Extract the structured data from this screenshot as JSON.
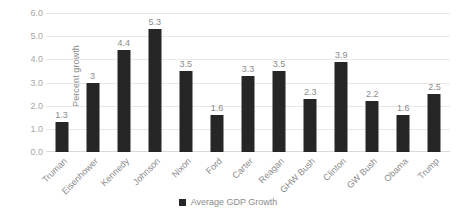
{
  "chart_data": {
    "type": "bar",
    "title": "",
    "xlabel": "",
    "ylabel": "Percent growth",
    "ylim": [
      0,
      6
    ],
    "ytick_step": 1,
    "ytick_labels": [
      "0.0",
      "1.0",
      "2.0",
      "3.0",
      "4.0",
      "5.0",
      "6.0"
    ],
    "grid": true,
    "legend_position": "bottom-center",
    "categories": [
      "Truman",
      "Eisenhower",
      "Kennedy",
      "Johnson",
      "Nixon",
      "Ford",
      "Carter",
      "Reagan",
      "GHW Bush",
      "Clinton",
      "GW Bush",
      "Obama",
      "Trump"
    ],
    "values": [
      1.3,
      3,
      4.4,
      5.3,
      3.5,
      1.6,
      3.3,
      3.5,
      2.3,
      3.9,
      2.2,
      1.6,
      2.5
    ],
    "value_labels": [
      "1.3",
      "3",
      "4.4",
      "5.3",
      "3.5",
      "1.6",
      "3.3",
      "3.5",
      "2.3",
      "3.9",
      "2.2",
      "1.6",
      "2.5"
    ],
    "series": [
      {
        "name": "Average GDP Growth",
        "color": "#262626",
        "values": [
          1.3,
          3,
          4.4,
          5.3,
          3.5,
          1.6,
          3.3,
          3.5,
          2.3,
          3.9,
          2.2,
          1.6,
          2.5
        ]
      }
    ],
    "colors": {
      "bar": "#262626",
      "gridline": "#e8e8e8",
      "axis_text": "#8c8c8c",
      "tick_text": "#a6a6a6",
      "background": "#ffffff"
    }
  },
  "legend": {
    "items": [
      {
        "label": "Average GDP Growth",
        "marker": "square-marker"
      }
    ]
  }
}
